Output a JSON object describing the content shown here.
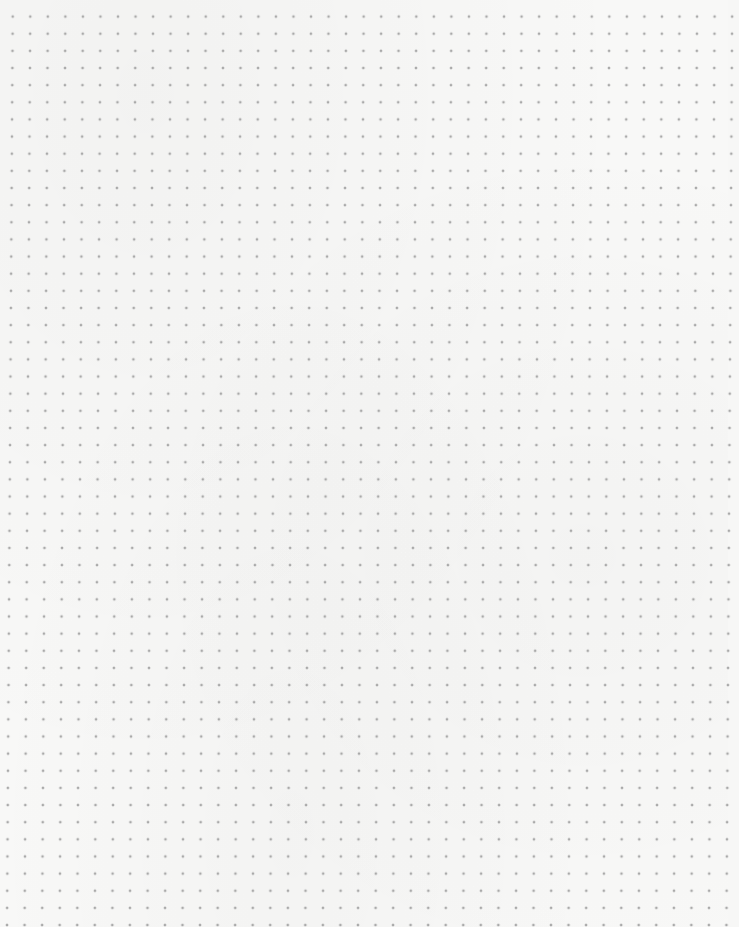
{
  "image": {
    "description": "dot grid paper",
    "background_color": "#f8f8f7",
    "dot_color": "#a9a9a9",
    "dot_spacing_px": {
      "x": 17.5,
      "y": 17.1
    },
    "approx_columns": 41,
    "approx_rows": 54
  }
}
